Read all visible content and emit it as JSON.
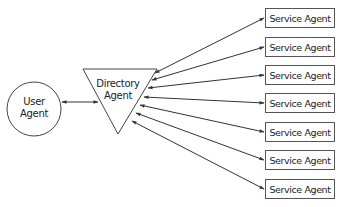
{
  "diagram": {
    "user_agent": {
      "label_line1": "User",
      "label_line2": "Agent"
    },
    "directory_agent": {
      "label_line1": "Directory",
      "label_line2": "Agent"
    },
    "service_agents": [
      {
        "label": "Service Agent"
      },
      {
        "label": "Service Agent"
      },
      {
        "label": "Service Agent"
      },
      {
        "label": "Service Agent"
      },
      {
        "label": "Service Agent"
      },
      {
        "label": "Service Agent"
      },
      {
        "label": "Service Agent"
      }
    ],
    "edges": [
      {
        "from": "User Agent",
        "to": "Directory Agent",
        "type": "bidirectional"
      },
      {
        "from": "Directory Agent",
        "to": "Service Agent 1",
        "type": "bidirectional"
      },
      {
        "from": "Directory Agent",
        "to": "Service Agent 2",
        "type": "bidirectional"
      },
      {
        "from": "Directory Agent",
        "to": "Service Agent 3",
        "type": "bidirectional"
      },
      {
        "from": "Directory Agent",
        "to": "Service Agent 4",
        "type": "bidirectional"
      },
      {
        "from": "Directory Agent",
        "to": "Service Agent 5",
        "type": "bidirectional"
      },
      {
        "from": "Directory Agent",
        "to": "Service Agent 6",
        "type": "bidirectional"
      },
      {
        "from": "Directory Agent",
        "to": "Service Agent 7",
        "type": "bidirectional"
      }
    ],
    "colors": {
      "stroke": "#333333",
      "background": "#ffffff"
    }
  }
}
